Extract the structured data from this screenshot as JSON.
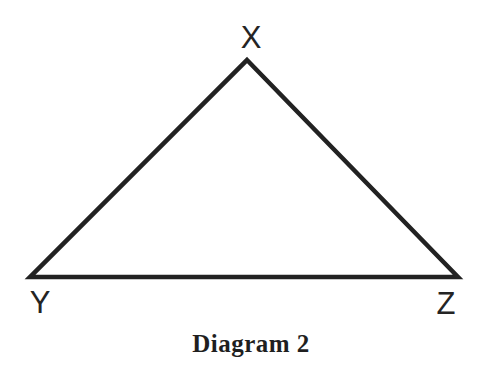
{
  "diagram": {
    "caption": "Diagram 2",
    "triangle_points": "247,60 458,277 30,277",
    "vertices": [
      {
        "id": "top",
        "label": "X"
      },
      {
        "id": "bottom-left",
        "label": "Y"
      },
      {
        "id": "bottom-right",
        "label": "Z"
      }
    ],
    "colors": {
      "line": "#222222",
      "text": "#242424",
      "background": "#ffffff"
    }
  }
}
